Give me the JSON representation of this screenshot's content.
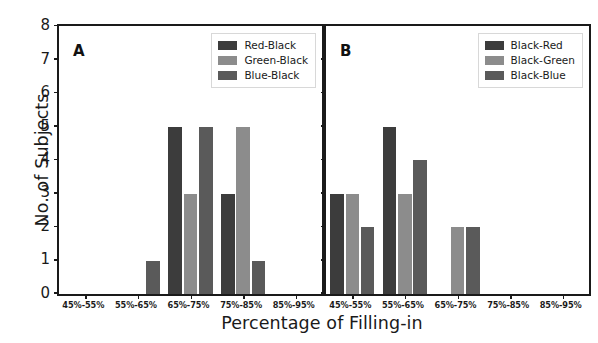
{
  "figure": {
    "xlabel": "Percentage of Filling-in",
    "ylabel": "No. of Subjects",
    "ytick_labels": [
      "8",
      "7",
      "6",
      "5",
      "4",
      "3",
      "2",
      "1",
      "0"
    ],
    "panel_a_letter": "A",
    "panel_b_letter": "B"
  },
  "colors": {
    "series1": "#3c3c3c",
    "series2": "#8c8c8c",
    "series3": "#5a5a5a",
    "axis": "#1a1a1a",
    "background": "#ffffff"
  },
  "chart_data": [
    {
      "type": "bar",
      "title": "A",
      "panel": "A",
      "categories": [
        "45%-55%",
        "55%-65%",
        "65%-75%",
        "75%-85%",
        "85%-95%"
      ],
      "series": [
        {
          "name": "Red-Black",
          "values": [
            0,
            0,
            5,
            3,
            0
          ],
          "color": "#3c3c3c"
        },
        {
          "name": "Green-Black",
          "values": [
            0,
            0,
            3,
            5,
            0
          ],
          "color": "#8c8c8c"
        },
        {
          "name": "Blue-Black",
          "values": [
            0,
            1,
            5,
            1,
            0
          ],
          "color": "#5a5a5a"
        }
      ],
      "xlabel": "Percentage of Filling-in",
      "ylabel": "No. of Subjects",
      "ylim": [
        0,
        8
      ],
      "ytick_values": [
        0,
        1,
        2,
        3,
        4,
        5,
        6,
        7,
        8
      ],
      "grid": false,
      "legend_position": "upper right"
    },
    {
      "type": "bar",
      "title": "B",
      "panel": "B",
      "categories": [
        "45%-55%",
        "55%-65%",
        "65%-75%",
        "75%-85%",
        "85%-95%"
      ],
      "series": [
        {
          "name": "Black-Red",
          "values": [
            3,
            5,
            0,
            0,
            0
          ],
          "color": "#3c3c3c"
        },
        {
          "name": "Black-Green",
          "values": [
            3,
            3,
            2,
            0,
            0
          ],
          "color": "#8c8c8c"
        },
        {
          "name": "Black-Blue",
          "values": [
            2,
            4,
            2,
            0,
            0
          ],
          "color": "#5a5a5a"
        }
      ],
      "xlabel": "Percentage of Filling-in",
      "ylabel": "No. of Subjects",
      "ylim": [
        0,
        8
      ],
      "ytick_values": [
        0,
        1,
        2,
        3,
        4,
        5,
        6,
        7,
        8
      ],
      "grid": false,
      "legend_position": "upper right"
    }
  ]
}
